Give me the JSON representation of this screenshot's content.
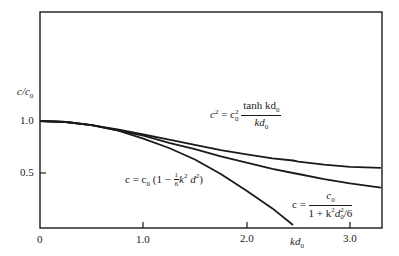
{
  "chart_data": {
    "type": "line",
    "title": "",
    "xlabel": "kd0",
    "ylabel": "c/c0",
    "xlim": [
      0,
      3.3
    ],
    "ylim": [
      0,
      1.0
    ],
    "grid": false,
    "legend": "inline annotations",
    "x_ticks": [
      {
        "value": 0,
        "label": "0"
      },
      {
        "value": 1.0,
        "label": "1.0"
      },
      {
        "value": 2.0,
        "label": "2.0"
      },
      {
        "value": 3.0,
        "label": "3.0"
      }
    ],
    "y_ticks": [
      {
        "value": 1.0,
        "label": "1.0"
      },
      {
        "value": 0.5,
        "label": "0.5"
      }
    ],
    "x": [
      0,
      0.25,
      0.5,
      0.75,
      1.0,
      1.25,
      1.5,
      1.75,
      2.0,
      2.25,
      2.449,
      2.5,
      2.75,
      3.0,
      3.3
    ],
    "series": [
      {
        "name": "c^2 = c0^2 tanh(kd0)/kd0",
        "values": [
          1.0,
          0.99,
          0.96,
          0.92,
          0.87,
          0.82,
          0.77,
          0.72,
          0.68,
          0.64,
          0.62,
          0.61,
          0.58,
          0.56,
          0.55
        ]
      },
      {
        "name": "c = c0 / (1 + k^2 d0^2 / 6)",
        "values": [
          1.0,
          0.99,
          0.96,
          0.91,
          0.86,
          0.79,
          0.73,
          0.66,
          0.6,
          0.54,
          0.5,
          0.49,
          0.44,
          0.4,
          0.36
        ]
      },
      {
        "name": "c = c0 (1 - k^2 d^2 / 6)",
        "values": [
          1.0,
          0.99,
          0.96,
          0.91,
          0.83,
          0.74,
          0.63,
          0.49,
          0.33,
          0.16,
          0.0,
          null,
          null,
          null,
          null
        ]
      }
    ],
    "annotations": [
      {
        "text": "c² = c0² tanh kd0 / kd0",
        "near_x": 2.1,
        "near_y": 0.62
      },
      {
        "text": "c = c0 (1 − 1/6 k² d²)",
        "near_x": 1.2,
        "near_y": 0.5
      },
      {
        "text": "c = c0 / (1 + k² d0²/6)",
        "near_x": 2.8,
        "near_y": 0.25
      }
    ]
  },
  "labels": {
    "ylabel_main": "c/c",
    "ylabel_sub": "0",
    "xlabel_main": "kd",
    "xlabel_sub": "0",
    "tick_x0": "0",
    "tick_x1": "1.0",
    "tick_x2": "2.0",
    "tick_x3": "3.0",
    "tick_y1": "1.0",
    "tick_y05": "0.5",
    "ann1": {
      "lhs": "c",
      "lhs_sup": "2",
      "eq": " = c",
      "c0_sub": "0",
      "c0_sup": "2",
      "num": "tanh kd",
      "num_sub": "0",
      "den": "kd",
      "den_sub": "0"
    },
    "ann2": {
      "text_a": "c = c",
      "sub": "0",
      "text_b": " (1 − ",
      "frac_num": "1",
      "frac_den": "6",
      "text_c": "k",
      "sup1": "2",
      "text_d": " d",
      "sup2": "2",
      "text_e": ")"
    },
    "ann3": {
      "lhs": "c = ",
      "num": "c",
      "num_sub": "0",
      "den_a": "1 + k",
      "den_sup": "2",
      "den_b": "d",
      "den_sub": "0",
      "den_sup2": "2",
      "den_c": "/6"
    }
  }
}
